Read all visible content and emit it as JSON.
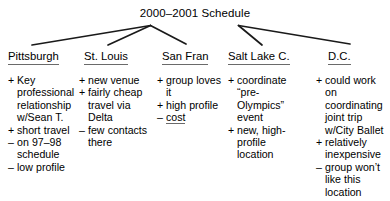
{
  "diagram": {
    "type": "tree-outline",
    "title": "2000–2001 Schedule",
    "columns": [
      {
        "header": "Pittsburgh",
        "items": [
          {
            "sign": "+",
            "text": "Key professional relationship w/Sean T.",
            "emphasis": false
          },
          {
            "sign": "+",
            "text": "short travel",
            "emphasis": false
          },
          {
            "sign": "–",
            "text": "on 97–98 schedule",
            "emphasis": false
          },
          {
            "sign": "–",
            "text": "low profile",
            "emphasis": false
          }
        ]
      },
      {
        "header": "St. Louis",
        "items": [
          {
            "sign": "+",
            "text": "new venue",
            "emphasis": false
          },
          {
            "sign": "+",
            "text": "fairly cheap travel via Delta",
            "emphasis": false
          },
          {
            "sign": "–",
            "text": "few contacts there",
            "emphasis": false
          }
        ]
      },
      {
        "header": "San Fran",
        "items": [
          {
            "sign": "+",
            "text": "group loves it",
            "emphasis": false
          },
          {
            "sign": "+",
            "text": "high profile",
            "emphasis": false
          },
          {
            "sign": "–",
            "text": "cost",
            "emphasis": true
          }
        ]
      },
      {
        "header": "Salt Lake C.",
        "items": [
          {
            "sign": "+",
            "text": "coordinate “pre-Olympics” event",
            "emphasis": false
          },
          {
            "sign": "+",
            "text": "new, high-profile location",
            "emphasis": false
          }
        ]
      },
      {
        "header": "D.C.",
        "items": [
          {
            "sign": "+",
            "text": "could work on coordinating joint trip w/City Ballet",
            "emphasis": false
          },
          {
            "sign": "+",
            "text": "relatively inexpensive",
            "emphasis": false
          },
          {
            "sign": "–",
            "text": "group won’t like this location",
            "emphasis": false
          }
        ]
      }
    ],
    "colors": {
      "ink": "#1a1a1a",
      "rule": "#6a6a6a",
      "background": "#ffffff"
    }
  }
}
